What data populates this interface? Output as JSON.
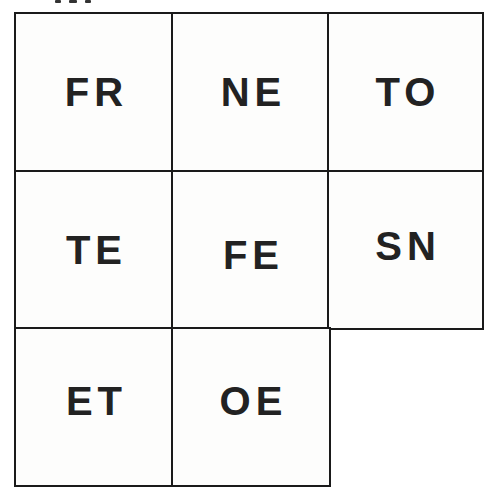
{
  "grid": {
    "rows": 3,
    "cols": 3,
    "border_color": "#1a1a1a",
    "text_color": "#222222",
    "cells": [
      {
        "row": 0,
        "col": 0,
        "label": "FR"
      },
      {
        "row": 0,
        "col": 1,
        "label": "NE"
      },
      {
        "row": 0,
        "col": 2,
        "label": "TO"
      },
      {
        "row": 1,
        "col": 0,
        "label": "TE"
      },
      {
        "row": 1,
        "col": 1,
        "label": "FE"
      },
      {
        "row": 1,
        "col": 2,
        "label": "SN"
      },
      {
        "row": 2,
        "col": 0,
        "label": "ET"
      },
      {
        "row": 2,
        "col": 1,
        "label": "OE"
      }
    ]
  }
}
